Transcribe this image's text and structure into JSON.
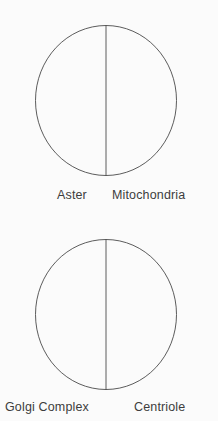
{
  "canvas": {
    "width": 218,
    "height": 421,
    "background_color": "#fbfbfb",
    "stroke_color": "#4a4a4a",
    "text_color": "#3d3d3d"
  },
  "figures": [
    {
      "id": "figure-1",
      "shape": "circle-split-vertical",
      "left_label": "Aster",
      "right_label": "Mitochondria"
    },
    {
      "id": "figure-2",
      "shape": "circle-split-vertical",
      "left_label": "Golgi Complex",
      "right_label": "Centriole"
    }
  ]
}
